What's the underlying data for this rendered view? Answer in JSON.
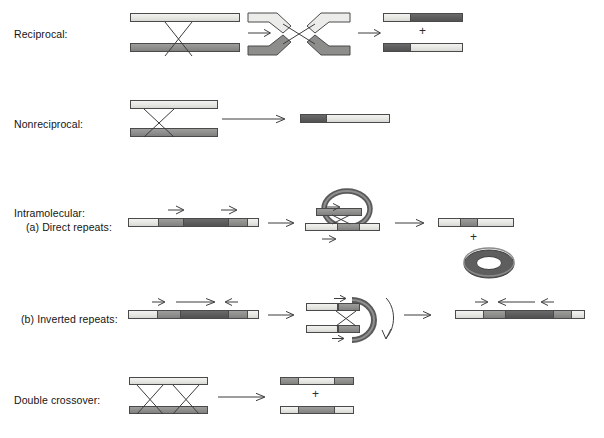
{
  "figure": {
    "type": "diagram"
  },
  "colors": {
    "light_segment": "#e6e6e3",
    "medium_segment": "#8e8e8c",
    "dark_segment": "#5c5c5c",
    "outline": "#4a4a4a",
    "background": "#ffffff",
    "text": "#141414"
  },
  "rows": [
    {
      "id": "reciprocal",
      "label": "Reciprocal:",
      "label_x": 14,
      "label_y": 34,
      "stages": [
        {
          "name": "parental-duplexes",
          "kind": "two-bars-crossed"
        },
        {
          "name": "holliday-crossover",
          "kind": "bent-strands"
        },
        {
          "name": "recombinant-products",
          "kind": "two-products",
          "joiner": "+"
        }
      ]
    },
    {
      "id": "nonreciprocal",
      "label": "Nonreciprocal:",
      "label_x": 14,
      "label_y": 125,
      "stages": [
        {
          "name": "parental-duplexes",
          "kind": "two-bars-crossed"
        },
        {
          "name": "single-product",
          "kind": "one-product"
        }
      ]
    },
    {
      "id": "intramolecular-direct",
      "label": "Intramolecular:",
      "label_sub": "(a) Direct repeats:",
      "label_x": 14,
      "label_y": 213,
      "label_sub_x": 26,
      "label_sub_y": 227,
      "stages": [
        {
          "name": "linear-with-direct-repeats",
          "kind": "segmented-bar",
          "arrows": [
            "right",
            "right"
          ]
        },
        {
          "name": "looped-intermediate",
          "kind": "loop-circle"
        },
        {
          "name": "deletion-product",
          "kind": "shortened-bar",
          "joiner": "+",
          "extra": "excised-circle"
        }
      ]
    },
    {
      "id": "intramolecular-inverted",
      "label": "(b) Inverted repeats:",
      "label_x": 21,
      "label_y": 318,
      "stages": [
        {
          "name": "linear-with-inverted-repeats",
          "kind": "segmented-bar",
          "arrows": [
            "right",
            "long-right",
            "left"
          ]
        },
        {
          "name": "hairpin-intermediate",
          "kind": "hairpin-loop"
        },
        {
          "name": "inversion-product",
          "kind": "segmented-bar",
          "arrows": [
            "right",
            "long-left",
            "left"
          ]
        }
      ]
    },
    {
      "id": "double-crossover",
      "label": "Double crossover:",
      "label_x": 14,
      "label_y": 400,
      "stages": [
        {
          "name": "parental-duplexes-double-x",
          "kind": "two-bars-double-crossed"
        },
        {
          "name": "double-crossover-products",
          "kind": "two-products",
          "joiner": "+"
        }
      ]
    }
  ],
  "symbols": {
    "plus": "+",
    "arrow_right": "→"
  }
}
